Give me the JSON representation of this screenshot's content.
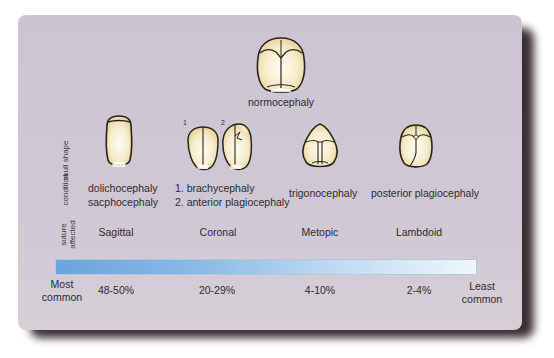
{
  "diagram": {
    "top_skull": {
      "label": "normocephaly",
      "icon": "normal-skull-icon"
    },
    "row_labels": {
      "skull_shape": "skull shape",
      "condition": "condition",
      "suture_affected_1": "suture",
      "suture_affected_2": "affected"
    },
    "columns": [
      {
        "icon": "dolichocephaly-skull-icon",
        "condition_lines": [
          "dolichocephaly",
          "sacphocephaly"
        ],
        "suture": "Sagittal",
        "frequency": "48-50%"
      },
      {
        "icon": "coronal-skulls-icon",
        "skull_numbers": [
          "1",
          "2"
        ],
        "condition_lines": [
          "1. brachycephaly",
          "2. anterior plagiocephaly"
        ],
        "suture": "Coronal",
        "frequency": "20-29%"
      },
      {
        "icon": "trigonocephaly-skull-icon",
        "condition_lines": [
          "trigonocephaly"
        ],
        "suture": "Metopic",
        "frequency": "4-10%"
      },
      {
        "icon": "posterior-plagiocephaly-skull-icon",
        "condition_lines": [
          "posterior plagiocephaly"
        ],
        "suture": "Lambdoid",
        "frequency": "2-4%"
      }
    ],
    "scale": {
      "left_label_1": "Most",
      "left_label_2": "common",
      "right_label_1": "Least",
      "right_label_2": "common",
      "gradient_start": "#6aa4dc",
      "gradient_end": "#eef6fd"
    },
    "colors": {
      "card_background": "#cbc4d3",
      "skull_fill": "#f3e6bf",
      "skull_outline": "#2a2418",
      "shadow": "#3a2f33"
    }
  }
}
